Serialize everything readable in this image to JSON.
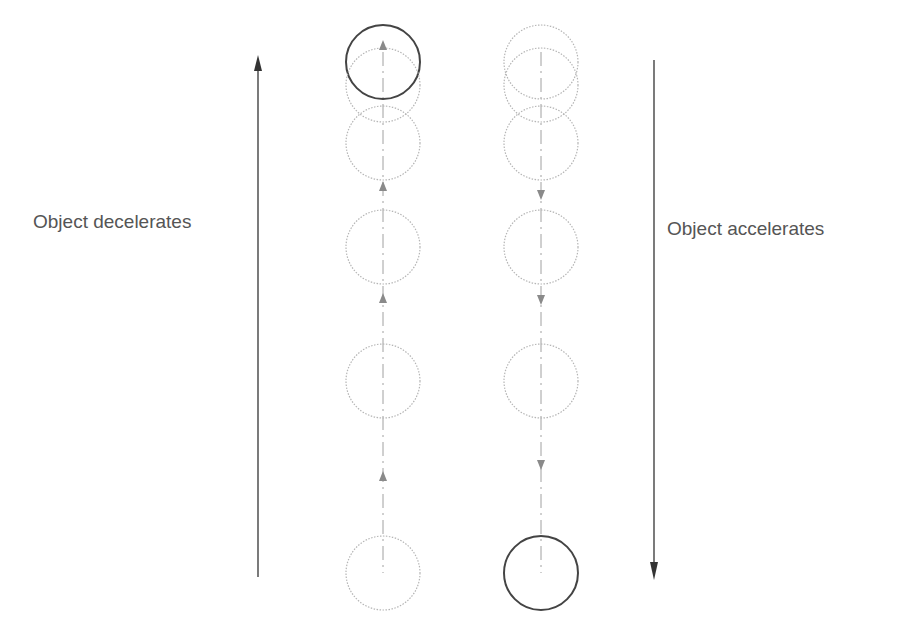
{
  "labels": {
    "left": "Object decelerates",
    "right": "Object accelerates"
  },
  "colors": {
    "solid_circle": "#444444",
    "dotted_circle": "#b5b5b5",
    "arrow": "#333333",
    "small_arrow": "#8a8a8a",
    "text": "#555555"
  },
  "diagram": {
    "left_column": {
      "center_x": 383,
      "radius": 37,
      "circle_y": [
        62,
        85,
        143,
        247,
        381,
        573
      ],
      "solid_index": 0,
      "direction": "up",
      "small_arrow_y": [
        40,
        181,
        293,
        471
      ]
    },
    "right_column": {
      "center_x": 541,
      "radius": 37,
      "circle_y": [
        62,
        85,
        143,
        247,
        381,
        573
      ],
      "solid_index": 5,
      "direction": "down",
      "small_arrow_y": [
        200,
        305,
        470
      ]
    },
    "left_arrow": {
      "x": 258,
      "y_top": 55,
      "y_bottom": 577,
      "direction": "up"
    },
    "right_arrow": {
      "x": 654,
      "y_top": 60,
      "y_bottom": 580,
      "direction": "down"
    }
  }
}
